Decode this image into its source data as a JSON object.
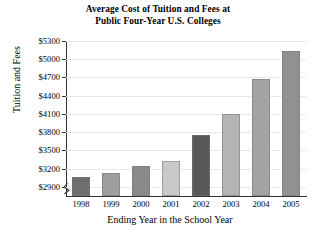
{
  "chart_data": {
    "type": "bar",
    "title": "Average Cost of Tuition and Fees at Public Four-Year U.S. Colleges",
    "title_lines": [
      "Average Cost of Tuition and Fees at",
      "Public Four-Year U.S. Colleges"
    ],
    "xlabel": "Ending Year in the School Year",
    "ylabel": "Tuition and Fees",
    "categories": [
      "1998",
      "1999",
      "2000",
      "2001",
      "2002",
      "2003",
      "2004",
      "2005"
    ],
    "values": [
      3060,
      3130,
      3240,
      3320,
      3750,
      4100,
      4680,
      5130
    ],
    "bar_colors": [
      "#6e6e6e",
      "#9e9e9e",
      "#8a8a8a",
      "#c9c9c9",
      "#595959",
      "#b5b5b5",
      "#a3a3a3",
      "#919191"
    ],
    "ylim": [
      2750,
      5300
    ],
    "y_axis_break": true,
    "y_tick_values": [
      2900,
      3200,
      3500,
      3800,
      4100,
      4400,
      4700,
      5000,
      5300
    ],
    "y_tick_labels": [
      "$2900",
      "$3200",
      "$3500",
      "$3800",
      "$4100",
      "$4400",
      "$4700",
      "$5000",
      "$5300"
    ],
    "grid": true,
    "legend": "none"
  }
}
